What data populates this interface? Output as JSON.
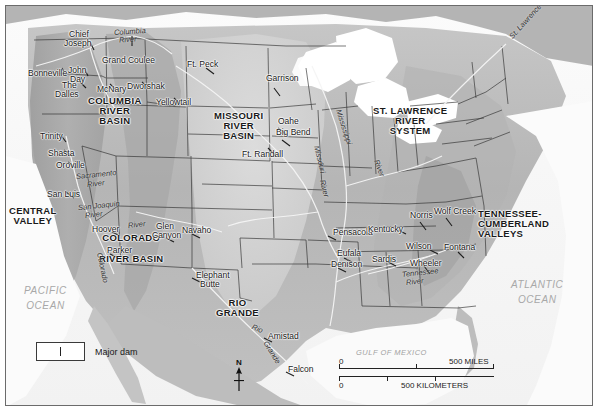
{
  "map": {
    "title": "Major Dams and River Basins of the United States",
    "frame_color": "#6b6b6b",
    "land_color": "#b9b9b9",
    "water_color": "#ffffff"
  },
  "basins": [
    {
      "name": "columbia-river-basin",
      "lines": [
        "COLUMBIA",
        "RIVER",
        "BASIN"
      ],
      "x": 82,
      "y": 90
    },
    {
      "name": "missouri-river-basin",
      "lines": [
        "MISSOURI",
        "RIVER",
        "BASIN"
      ],
      "x": 208,
      "y": 105
    },
    {
      "name": "st-lawrence-river-system",
      "lines": [
        "ST. LAWRENCE",
        "RIVER",
        "SYSTEM"
      ],
      "x": 373,
      "y": 100
    },
    {
      "name": "central-valley",
      "lines": [
        "CENTRAL",
        "VALLEY"
      ],
      "x": 5,
      "y": 200
    },
    {
      "name": "colorado-river-basin",
      "lines": [
        "COLORADO",
        "RIVER BASIN"
      ],
      "x": 95,
      "y": 227
    },
    {
      "name": "rio-grande",
      "lines": [
        "RIO",
        "GRANDE"
      ],
      "x": 212,
      "y": 292
    },
    {
      "name": "tennessee-cumberland-valleys",
      "lines": [
        "TENNESSEE-",
        "CUMBERLAND",
        "VALLEYS"
      ],
      "x": 477,
      "y": 203
    }
  ],
  "dams": [
    {
      "label": "Chief",
      "x": 63,
      "y": 28
    },
    {
      "label": "Joseph",
      "x": 58,
      "y": 37
    },
    {
      "label": "Grand Coulee",
      "x": 96,
      "y": 55
    },
    {
      "label": "Bonneville",
      "x": 27,
      "y": 68
    },
    {
      "label": "John",
      "x": 67,
      "y": 65
    },
    {
      "label": "Day",
      "x": 68,
      "y": 73
    },
    {
      "label": "The",
      "x": 61,
      "y": 80
    },
    {
      "label": "Dalles",
      "x": 55,
      "y": 88
    },
    {
      "label": "McNary",
      "x": 96,
      "y": 83
    },
    {
      "label": "Dworshak",
      "x": 126,
      "y": 81
    },
    {
      "label": "Yellowtail",
      "x": 155,
      "y": 97
    },
    {
      "label": "Ft. Peck",
      "x": 186,
      "y": 58
    },
    {
      "label": "Garrison",
      "x": 265,
      "y": 73
    },
    {
      "label": "Oahe",
      "x": 276,
      "y": 115
    },
    {
      "label": "Big Bend",
      "x": 274,
      "y": 126
    },
    {
      "label": "Ft. Randall",
      "x": 241,
      "y": 148
    },
    {
      "label": "Trinity",
      "x": 39,
      "y": 130
    },
    {
      "label": "Shasta",
      "x": 47,
      "y": 147
    },
    {
      "label": "Oroville",
      "x": 54,
      "y": 159
    },
    {
      "label": "San Luis",
      "x": 45,
      "y": 188
    },
    {
      "label": "Hoover",
      "x": 91,
      "y": 222
    },
    {
      "label": "Parker",
      "x": 107,
      "y": 243
    },
    {
      "label": "Glen",
      "x": 155,
      "y": 220
    },
    {
      "label": "Canyon",
      "x": 152,
      "y": 228
    },
    {
      "label": "Navaho",
      "x": 180,
      "y": 223
    },
    {
      "label": "Elephant",
      "x": 194,
      "y": 268
    },
    {
      "label": "Butte",
      "x": 198,
      "y": 277
    },
    {
      "label": "Amistad",
      "x": 266,
      "y": 329
    },
    {
      "label": "Falcon",
      "x": 285,
      "y": 362
    },
    {
      "label": "Denison",
      "x": 330,
      "y": 257
    },
    {
      "label": "Eufala",
      "x": 335,
      "y": 246
    },
    {
      "label": "Pensacola",
      "x": 332,
      "y": 225
    },
    {
      "label": "Kentucky",
      "x": 367,
      "y": 222
    },
    {
      "label": "Sardis",
      "x": 371,
      "y": 252
    },
    {
      "label": "Norris",
      "x": 409,
      "y": 209
    },
    {
      "label": "Wolf Creek",
      "x": 434,
      "y": 205
    },
    {
      "label": "Wilson",
      "x": 405,
      "y": 239
    },
    {
      "label": "Fontana",
      "x": 443,
      "y": 240
    },
    {
      "label": "Wheeler",
      "x": 409,
      "y": 256
    }
  ],
  "rivers": [
    {
      "label": "Columbia",
      "x": 108,
      "y": 26,
      "rot": -4,
      "size": 7.5
    },
    {
      "label": "River",
      "x": 113,
      "y": 34,
      "rot": -4,
      "size": 7.5
    },
    {
      "label": "Mississippi",
      "x": 338,
      "y": 103,
      "rot": 72,
      "size": 7.5
    },
    {
      "label": "Missouri",
      "x": 313,
      "y": 138,
      "rot": 76,
      "size": 7.5
    },
    {
      "label": "River",
      "x": 318,
      "y": 172,
      "rot": 76,
      "size": 7.5
    },
    {
      "label": "River",
      "x": 372,
      "y": 152,
      "rot": 70,
      "size": 7.5
    },
    {
      "label": "St. Lawrence River",
      "x": 520,
      "y": 30,
      "rot": -48,
      "size": 7.5
    },
    {
      "label": "Sacramento",
      "x": 73,
      "y": 168,
      "rot": -6,
      "size": 7.5
    },
    {
      "label": "River",
      "x": 84,
      "y": 177,
      "rot": -6,
      "size": 7.5
    },
    {
      "label": "San Joaquin",
      "x": 75,
      "y": 199,
      "rot": -6,
      "size": 7.5
    },
    {
      "label": "River",
      "x": 82,
      "y": 208,
      "rot": -6,
      "size": 7.5
    },
    {
      "label": "River",
      "x": 125,
      "y": 218,
      "rot": -6,
      "size": 7.5
    },
    {
      "label": "Colorado",
      "x": 96,
      "y": 245,
      "rot": 78,
      "size": 7.5
    },
    {
      "label": "Rio",
      "x": 249,
      "y": 320,
      "rot": 22,
      "size": 7.5
    },
    {
      "label": "Grande",
      "x": 262,
      "y": 335,
      "rot": 58,
      "size": 7.5
    },
    {
      "label": "Tennessee",
      "x": 400,
      "y": 266,
      "rot": -6,
      "size": 7.5
    },
    {
      "label": "River",
      "x": 404,
      "y": 275,
      "rot": -6,
      "size": 7.5
    }
  ],
  "oceans": [
    {
      "name": "pacific-ocean",
      "lines": [
        "PACIFIC",
        "OCEAN"
      ],
      "x": 22,
      "y": 283
    },
    {
      "name": "atlantic-ocean",
      "lines": [
        "ATLANTIC",
        "OCEAN"
      ],
      "x": 513,
      "y": 277
    }
  ],
  "gulf": {
    "label": "GULF OF MEXICO",
    "x": 355,
    "y": 345
  },
  "legend": {
    "dam_symbol_name": "major-dam-symbol",
    "text": "Major dam"
  },
  "scale": {
    "miles": {
      "zero": "0",
      "max": "500",
      "unit": "MILES"
    },
    "kilometers": {
      "zero": "0",
      "max": "500",
      "unit": "KILOMETERS"
    }
  },
  "compass": {
    "north": "N"
  }
}
